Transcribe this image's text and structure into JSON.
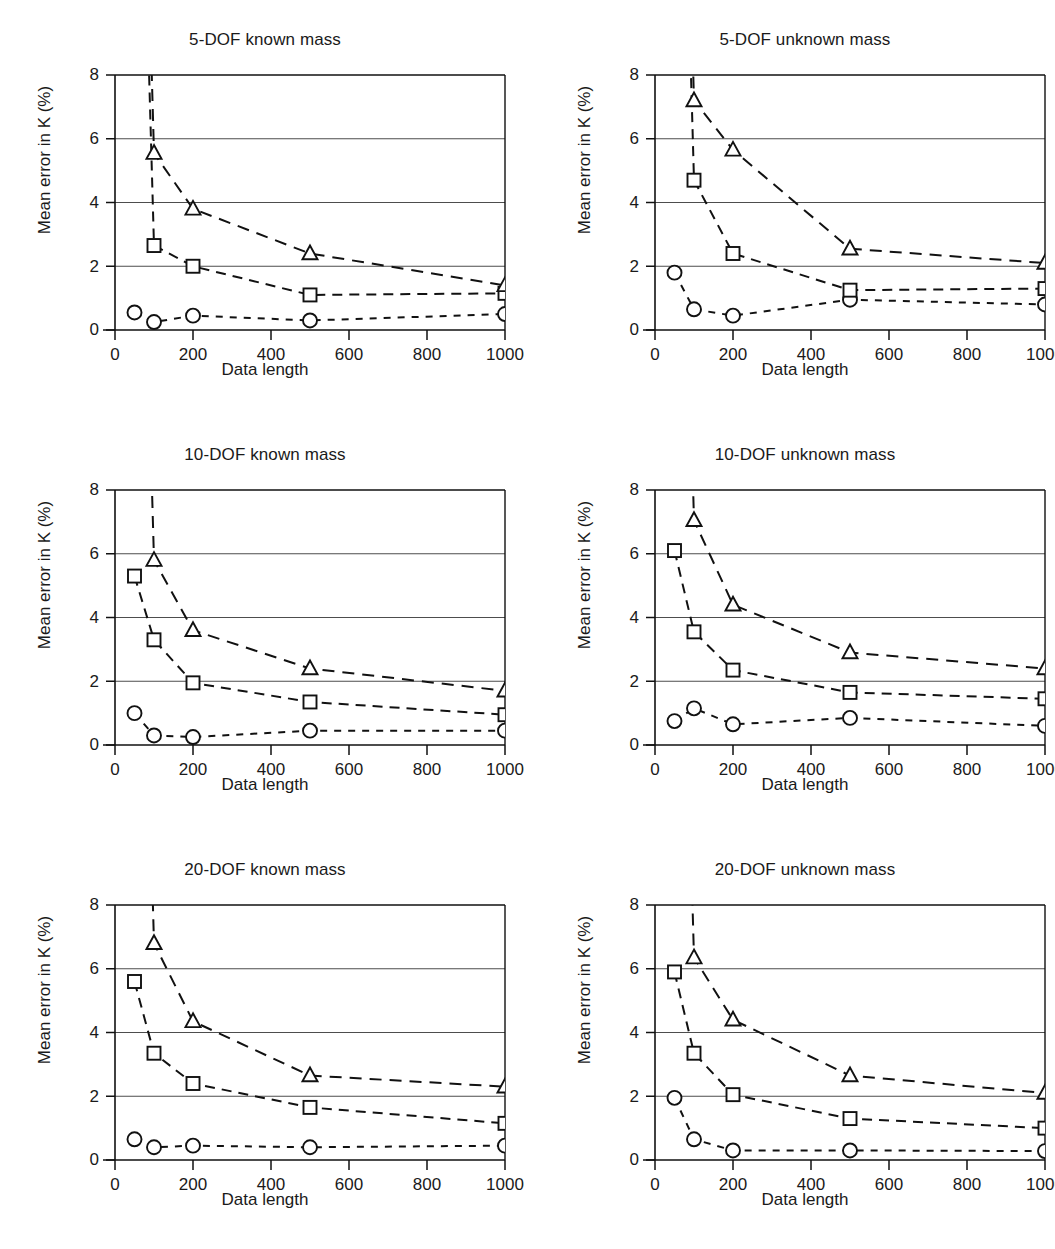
{
  "figure": {
    "panel_count": 6,
    "columns": 2,
    "rows": 3
  },
  "axes": {
    "xlabel": "Data length",
    "ylabel": "Mean error in K (%)",
    "xticks": [
      0,
      200,
      400,
      600,
      800,
      1000
    ],
    "yticks": [
      0,
      2,
      4,
      6,
      8
    ],
    "xlim": [
      0,
      1000
    ],
    "ylim": [
      0,
      8
    ],
    "grid": "horizontal"
  },
  "markers": {
    "circle": "circle-marker",
    "square": "square-marker",
    "triangle": "triangle-marker"
  },
  "colors": {
    "line": "#111111",
    "grid": "#4d4d4d",
    "marker_fill": "#ffffff",
    "background": "#ffffff"
  },
  "chart_data": [
    {
      "type": "line",
      "title": "5-DOF known mass",
      "xlabel": "Data length",
      "ylabel": "Mean error in K (%)",
      "xlim": [
        0,
        1000
      ],
      "ylim": [
        0,
        8
      ],
      "xticks": [
        0,
        200,
        400,
        600,
        800,
        1000
      ],
      "yticks": [
        0,
        2,
        4,
        6,
        8
      ],
      "grid": "horizontal",
      "legend": "none",
      "x": [
        50,
        100,
        200,
        500,
        1000
      ],
      "series": [
        {
          "name": "circle",
          "marker": "circle",
          "values": [
            0.55,
            0.25,
            0.45,
            0.3,
            0.5
          ]
        },
        {
          "name": "square",
          "marker": "square",
          "values": [
            null,
            2.65,
            2.0,
            1.1,
            1.15
          ]
        },
        {
          "name": "triangle",
          "marker": "triangle",
          "values": [
            null,
            5.55,
            3.8,
            2.4,
            1.4
          ]
        }
      ],
      "offscale_note": "square and triangle series rise above y=8 at x=50"
    },
    {
      "type": "line",
      "title": "5-DOF unknown mass",
      "xlabel": "Data length",
      "ylabel": "Mean error in K (%)",
      "xlim": [
        0,
        1000
      ],
      "ylim": [
        0,
        8
      ],
      "xticks": [
        0,
        200,
        400,
        600,
        800,
        1000
      ],
      "yticks": [
        0,
        2,
        4,
        6,
        8
      ],
      "grid": "horizontal",
      "legend": "none",
      "x": [
        50,
        100,
        200,
        500,
        1000
      ],
      "series": [
        {
          "name": "circle",
          "marker": "circle",
          "values": [
            1.8,
            0.65,
            0.45,
            0.95,
            0.8
          ]
        },
        {
          "name": "square",
          "marker": "square",
          "values": [
            null,
            4.7,
            2.4,
            1.25,
            1.3
          ]
        },
        {
          "name": "triangle",
          "marker": "triangle",
          "values": [
            null,
            7.2,
            5.65,
            2.55,
            2.1
          ]
        }
      ],
      "offscale_note": "square and triangle series rise above y=8 at x=50"
    },
    {
      "type": "line",
      "title": "10-DOF known mass",
      "xlabel": "Data length",
      "ylabel": "Mean error in K (%)",
      "xlim": [
        0,
        1000
      ],
      "ylim": [
        0,
        8
      ],
      "xticks": [
        0,
        200,
        400,
        600,
        800,
        1000
      ],
      "yticks": [
        0,
        2,
        4,
        6,
        8
      ],
      "grid": "horizontal",
      "legend": "none",
      "x": [
        50,
        100,
        200,
        500,
        1000
      ],
      "series": [
        {
          "name": "circle",
          "marker": "circle",
          "values": [
            1.0,
            0.3,
            0.25,
            0.45,
            0.45
          ]
        },
        {
          "name": "square",
          "marker": "square",
          "values": [
            5.3,
            3.3,
            1.95,
            1.35,
            0.95
          ]
        },
        {
          "name": "triangle",
          "marker": "triangle",
          "values": [
            null,
            5.8,
            3.6,
            2.4,
            1.7
          ]
        }
      ],
      "offscale_note": "triangle series rises above y=8 at x=50"
    },
    {
      "type": "line",
      "title": "10-DOF unknown mass",
      "xlabel": "Data length",
      "ylabel": "Mean error in K (%)",
      "xlim": [
        0,
        1000
      ],
      "ylim": [
        0,
        8
      ],
      "xticks": [
        0,
        200,
        400,
        600,
        800,
        1000
      ],
      "yticks": [
        0,
        2,
        4,
        6,
        8
      ],
      "grid": "horizontal",
      "legend": "none",
      "x": [
        50,
        100,
        200,
        500,
        1000
      ],
      "series": [
        {
          "name": "circle",
          "marker": "circle",
          "values": [
            0.75,
            1.15,
            0.65,
            0.85,
            0.6
          ]
        },
        {
          "name": "square",
          "marker": "square",
          "values": [
            6.1,
            3.55,
            2.35,
            1.65,
            1.45
          ]
        },
        {
          "name": "triangle",
          "marker": "triangle",
          "values": [
            null,
            7.05,
            4.4,
            2.9,
            2.4
          ]
        }
      ],
      "offscale_note": "triangle series rises above y=8 at x=50"
    },
    {
      "type": "line",
      "title": "20-DOF known mass",
      "xlabel": "Data length",
      "ylabel": "Mean error in K (%)",
      "xlim": [
        0,
        1000
      ],
      "ylim": [
        0,
        8
      ],
      "xticks": [
        0,
        200,
        400,
        600,
        800,
        1000
      ],
      "yticks": [
        0,
        2,
        4,
        6,
        8
      ],
      "grid": "horizontal",
      "legend": "none",
      "x": [
        50,
        100,
        200,
        500,
        1000
      ],
      "series": [
        {
          "name": "circle",
          "marker": "circle",
          "values": [
            0.65,
            0.4,
            0.45,
            0.4,
            0.45
          ]
        },
        {
          "name": "square",
          "marker": "square",
          "values": [
            5.6,
            3.35,
            2.4,
            1.65,
            1.15
          ]
        },
        {
          "name": "triangle",
          "marker": "triangle",
          "values": [
            null,
            6.8,
            4.35,
            2.65,
            2.3
          ]
        }
      ],
      "offscale_note": "triangle series rises above y=8 at x=50"
    },
    {
      "type": "line",
      "title": "20-DOF unknown mass",
      "xlabel": "Data length",
      "ylabel": "Mean error in K (%)",
      "xlim": [
        0,
        1000
      ],
      "ylim": [
        0,
        8
      ],
      "xticks": [
        0,
        200,
        400,
        600,
        800,
        1000
      ],
      "yticks": [
        0,
        2,
        4,
        6,
        8
      ],
      "grid": "horizontal",
      "legend": "none",
      "x": [
        50,
        100,
        200,
        500,
        1000
      ],
      "series": [
        {
          "name": "circle",
          "marker": "circle",
          "values": [
            1.95,
            0.65,
            0.3,
            0.3,
            0.28
          ]
        },
        {
          "name": "square",
          "marker": "square",
          "values": [
            5.9,
            3.35,
            2.05,
            1.3,
            1.0
          ]
        },
        {
          "name": "triangle",
          "marker": "triangle",
          "values": [
            null,
            6.35,
            4.4,
            2.65,
            2.1
          ]
        }
      ],
      "offscale_note": "triangle series rises above y=8 at x=50"
    }
  ]
}
